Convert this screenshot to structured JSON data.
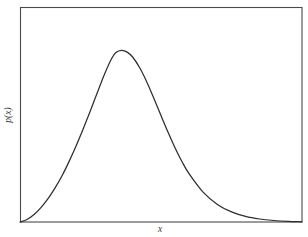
{
  "figure": {
    "background_color": "#ffffff",
    "frame_color": "#4a4a4a",
    "curve_color": "#2e2e2e",
    "label_color": "#3a3a3a"
  },
  "axes": {
    "x_label": "x",
    "y_label": "p(x)"
  },
  "chart_data": {
    "type": "line",
    "title": "",
    "subtitle": "",
    "xlabel": "x",
    "ylabel": "p(x)",
    "legend": [],
    "legend_position": "none",
    "grid": false,
    "ticks": {
      "x": [],
      "y": []
    },
    "xlim": [
      0,
      1
    ],
    "ylim": [
      0,
      1
    ],
    "series": [
      {
        "name": "p(x)",
        "color": "#2e2e2e",
        "x": [
          0.0,
          0.025,
          0.05,
          0.075,
          0.1,
          0.125,
          0.15,
          0.175,
          0.2,
          0.225,
          0.25,
          0.275,
          0.3,
          0.325,
          0.34,
          0.36,
          0.38,
          0.4,
          0.425,
          0.45,
          0.475,
          0.5,
          0.525,
          0.55,
          0.575,
          0.6,
          0.65,
          0.7,
          0.75,
          0.8,
          0.85,
          0.9,
          0.95,
          1.0
        ],
        "y": [
          0.0,
          0.012,
          0.035,
          0.068,
          0.11,
          0.16,
          0.218,
          0.285,
          0.358,
          0.437,
          0.52,
          0.606,
          0.69,
          0.762,
          0.79,
          0.8,
          0.792,
          0.768,
          0.718,
          0.652,
          0.576,
          0.496,
          0.418,
          0.345,
          0.28,
          0.224,
          0.138,
          0.082,
          0.047,
          0.026,
          0.014,
          0.007,
          0.003,
          0.001
        ]
      }
    ],
    "peak": {
      "x": 0.352,
      "y": 0.8
    }
  }
}
